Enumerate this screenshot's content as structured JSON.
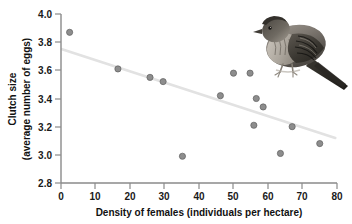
{
  "chart_data": {
    "type": "scatter",
    "title": "",
    "xlabel": "Density of females (individuals per hectare)",
    "ylabel_line1": "Clutch size",
    "ylabel_line2": "(average number of eggs)",
    "xlim": [
      0,
      80
    ],
    "ylim": [
      2.8,
      4.0
    ],
    "xticks": [
      0,
      10,
      20,
      30,
      40,
      50,
      60,
      70,
      80
    ],
    "yticks": [
      2.8,
      3.0,
      3.2,
      3.4,
      3.6,
      3.8,
      4.0
    ],
    "xticklabels": [
      "0",
      "10",
      "20",
      "30",
      "40",
      "50",
      "60",
      "70",
      "80"
    ],
    "yticklabels": [
      "2.8",
      "3.0",
      "3.2",
      "3.4",
      "3.6",
      "3.8",
      "4.0"
    ],
    "grid": false,
    "legend": "none",
    "point_color": "#8d8d8d",
    "trendline_color": "#e2e2e2",
    "axis_color": "#8a8a8a",
    "points": [
      {
        "x": 2.5,
        "y": 3.87
      },
      {
        "x": 16.5,
        "y": 3.61
      },
      {
        "x": 25.8,
        "y": 3.55
      },
      {
        "x": 29.6,
        "y": 3.52
      },
      {
        "x": 35.2,
        "y": 2.99
      },
      {
        "x": 46.2,
        "y": 3.42
      },
      {
        "x": 50.0,
        "y": 3.58
      },
      {
        "x": 54.8,
        "y": 3.58
      },
      {
        "x": 55.9,
        "y": 3.21
      },
      {
        "x": 56.6,
        "y": 3.4
      },
      {
        "x": 58.6,
        "y": 3.34
      },
      {
        "x": 63.6,
        "y": 3.01
      },
      {
        "x": 67.0,
        "y": 3.2
      },
      {
        "x": 75.0,
        "y": 3.08
      }
    ],
    "trendline": {
      "x0": 0.3,
      "y0": 3.75,
      "x1": 79.5,
      "y1": 3.12
    },
    "annotation_image": "sparrow-photo"
  },
  "figure": {
    "bird_label": "sparrow-photo"
  }
}
